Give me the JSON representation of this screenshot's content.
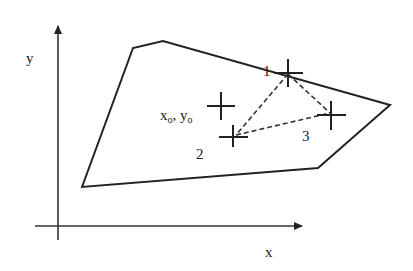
{
  "axes": {
    "x_label": "x",
    "y_label": "y"
  },
  "polygon": {
    "vertices": [
      [
        82,
        187
      ],
      [
        133,
        48
      ],
      [
        163,
        41
      ],
      [
        390,
        105
      ],
      [
        318,
        168
      ]
    ]
  },
  "points": {
    "origin_label_main_x": "x",
    "origin_label_sub_x": "o",
    "origin_label_sep": ", ",
    "origin_label_main_y": "y",
    "origin_label_sub_y": "o",
    "p1_label": "1",
    "p2_label": "2",
    "p3_label": "3"
  },
  "colors": {
    "stroke": "#222222",
    "background": "#ffffff"
  }
}
